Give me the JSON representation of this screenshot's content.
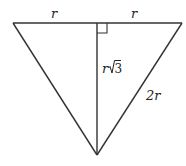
{
  "diagram": {
    "type": "triangle",
    "vertices": {
      "top_left": [
        13,
        23
      ],
      "top_right": [
        182,
        23
      ],
      "bottom": [
        97,
        155
      ],
      "altitude_foot": [
        97,
        23
      ]
    },
    "labels": {
      "top_left_half": "r",
      "top_right_half": "r",
      "altitude": "r",
      "altitude_radical": "√3",
      "altitude_radicand": "3",
      "right_side": "2r"
    },
    "right_angle_marker": true,
    "line_color": "#333333",
    "text_color": "#222222",
    "background": "#ffffff"
  }
}
